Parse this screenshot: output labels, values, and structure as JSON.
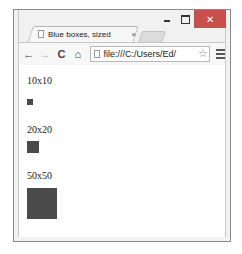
{
  "window": {
    "controls": {
      "minimize": "–",
      "maximize": "□",
      "close": "✕"
    },
    "close_color": "#c7504d"
  },
  "tab": {
    "title": "Blue boxes, sized",
    "close_label": "×",
    "icon": "page-icon"
  },
  "toolbar": {
    "back_icon": "←",
    "forward_icon": "→",
    "reload_icon": "C",
    "home_icon": "⌂",
    "url": "file:///C:/Users/Ed/",
    "star_icon": "☆"
  },
  "page": {
    "items": [
      {
        "label": "10x10",
        "size": 10
      },
      {
        "label": "20x20",
        "size": 20
      },
      {
        "label": "50x50",
        "size": 50
      }
    ],
    "box_color": "#4a4a4a"
  }
}
